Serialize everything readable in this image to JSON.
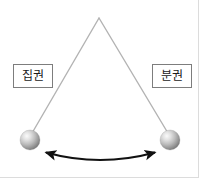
{
  "figure": {
    "background_color": "#ffffff",
    "width": 199,
    "height": 178
  },
  "pendulum": {
    "pivot": {
      "x": 99,
      "y": 18
    },
    "string_color": "#b3b3b3",
    "string_width": 1.4,
    "bob_radius": 10,
    "bob_color_light": "#f2f2f2",
    "bob_color_mid": "#b8b8b8",
    "bob_color_dark": "#7a7a7a",
    "left_bob": {
      "x": 30,
      "y": 140
    },
    "right_bob": {
      "x": 170,
      "y": 140
    }
  },
  "labels": {
    "left": {
      "text": "집권",
      "border_color": "#7d7d7d",
      "text_color": "#1a1a1a"
    },
    "right": {
      "text": "분권",
      "border_color": "#7d7d7d",
      "text_color": "#1a1a1a"
    }
  },
  "swing_arrow": {
    "color": "#111111",
    "stroke_width": 2,
    "start": {
      "x": 46,
      "y": 153
    },
    "end": {
      "x": 155,
      "y": 153
    },
    "control": {
      "x": 100,
      "y": 168
    },
    "double_headed": true
  },
  "page_border": {
    "color": "#dcdcdc",
    "visible_edges": "right-and-bottom"
  }
}
